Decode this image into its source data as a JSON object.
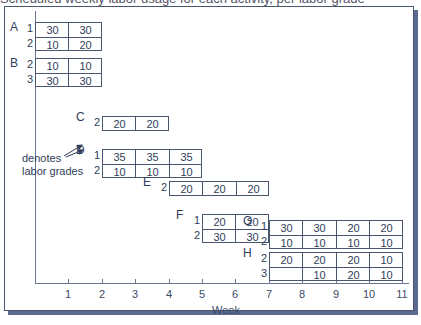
{
  "header_fragment": "Scheduled weekly labor usage for each activity, per labor grade",
  "axis": {
    "xlabel": "Week",
    "ticks": [
      "1",
      "2",
      "3",
      "4",
      "5",
      "6",
      "7",
      "8",
      "9",
      "10",
      "11"
    ]
  },
  "annotation": {
    "line1": "denotes",
    "line2": "labor grades"
  },
  "activities": [
    {
      "name": "A",
      "start": 0,
      "rows": [
        {
          "grade": "1",
          "values": [
            "30",
            "30"
          ]
        },
        {
          "grade": "2",
          "values": [
            "10",
            "20"
          ]
        }
      ]
    },
    {
      "name": "B",
      "start": 0,
      "rows": [
        {
          "grade": "2",
          "values": [
            "10",
            "10"
          ]
        },
        {
          "grade": "3",
          "values": [
            "30",
            "30"
          ]
        }
      ]
    },
    {
      "name": "C",
      "start": 2,
      "rows": [
        {
          "grade": "2",
          "values": [
            "20",
            "20"
          ]
        }
      ]
    },
    {
      "name": "D",
      "start": 2,
      "rows": [
        {
          "grade": "1",
          "values": [
            "35",
            "35",
            "35"
          ]
        },
        {
          "grade": "2",
          "values": [
            "10",
            "10",
            "10"
          ]
        }
      ]
    },
    {
      "name": "E",
      "start": 4,
      "rows": [
        {
          "grade": "2",
          "values": [
            "20",
            "20",
            "20"
          ]
        }
      ]
    },
    {
      "name": "F",
      "start": 5,
      "rows": [
        {
          "grade": "1",
          "values": [
            "20",
            "20"
          ]
        },
        {
          "grade": "2",
          "values": [
            "30",
            "30"
          ]
        }
      ]
    },
    {
      "name": "G",
      "start": 7,
      "rows": [
        {
          "grade": "1",
          "values": [
            "30",
            "30",
            "20",
            "20"
          ]
        },
        {
          "grade": "2",
          "values": [
            "10",
            "10",
            "10",
            "10"
          ]
        }
      ]
    },
    {
      "name": "H",
      "start": 7,
      "rows": [
        {
          "grade": "2",
          "values": [
            "20",
            "20",
            "20",
            "10"
          ]
        },
        {
          "grade": "3",
          "values": [
            "",
            "10",
            "20",
            "10"
          ]
        }
      ]
    }
  ],
  "chart_data": {
    "type": "table",
    "xlabel": "Week",
    "ylabel": "",
    "x_ticks": [
      1,
      2,
      3,
      4,
      5,
      6,
      7,
      8,
      9,
      10,
      11
    ],
    "activities": {
      "A": {
        "weeks": [
          1,
          2
        ],
        "grade_1": [
          30,
          30
        ],
        "grade_2": [
          10,
          20
        ]
      },
      "B": {
        "weeks": [
          1,
          2
        ],
        "grade_2": [
          10,
          10
        ],
        "grade_3": [
          30,
          30
        ]
      },
      "C": {
        "weeks": [
          3,
          4
        ],
        "grade_2": [
          20,
          20
        ]
      },
      "D": {
        "weeks": [
          3,
          4,
          5
        ],
        "grade_1": [
          35,
          35,
          35
        ],
        "grade_2": [
          10,
          10,
          10
        ]
      },
      "E": {
        "weeks": [
          5,
          6,
          7
        ],
        "grade_2": [
          20,
          20,
          20
        ]
      },
      "F": {
        "weeks": [
          6,
          7
        ],
        "grade_1": [
          20,
          20
        ],
        "grade_2": [
          30,
          30
        ]
      },
      "G": {
        "weeks": [
          8,
          9,
          10,
          11
        ],
        "grade_1": [
          30,
          30,
          20,
          20
        ],
        "grade_2": [
          10,
          10,
          10,
          10
        ]
      },
      "H": {
        "weeks": [
          8,
          9,
          10,
          11
        ],
        "grade_2": [
          20,
          20,
          20,
          10
        ],
        "grade_3": [
          null,
          10,
          20,
          10
        ]
      }
    },
    "annotations": [
      "denotes labor grades"
    ]
  }
}
